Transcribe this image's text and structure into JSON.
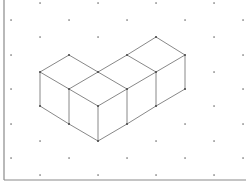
{
  "diagram": {
    "colors": {
      "background": "#ffffff",
      "edge": "#7a7a7a",
      "dot": "#555555",
      "frame": "#8a8a8a"
    },
    "frame": {
      "left_x": 4,
      "bottom_y": 180
    },
    "grid": {
      "odd_columns_x": [
        11,
        69,
        127,
        185,
        243
      ],
      "odd_rows_y": [
        20,
        55,
        89,
        124,
        158
      ],
      "even_columns_x": [
        40,
        98,
        156,
        214
      ],
      "even_rows_y": [
        3,
        37,
        72,
        106,
        141,
        175
      ]
    },
    "vertices": [
      [
        69,
        55
      ],
      [
        40,
        72
      ],
      [
        98,
        72
      ],
      [
        127,
        55
      ],
      [
        156,
        37
      ],
      [
        185,
        55
      ],
      [
        156,
        72
      ],
      [
        127,
        89
      ],
      [
        69,
        89
      ],
      [
        98,
        106
      ],
      [
        40,
        106
      ],
      [
        69,
        124
      ],
      [
        98,
        141
      ],
      [
        127,
        124
      ],
      [
        156,
        106
      ],
      [
        185,
        89
      ]
    ],
    "edges": [
      [
        [
          69,
          55
        ],
        [
          40,
          72
        ]
      ],
      [
        [
          69,
          55
        ],
        [
          98,
          72
        ]
      ],
      [
        [
          98,
          72
        ],
        [
          127,
          55
        ]
      ],
      [
        [
          127,
          55
        ],
        [
          156,
          37
        ]
      ],
      [
        [
          156,
          37
        ],
        [
          185,
          55
        ]
      ],
      [
        [
          127,
          55
        ],
        [
          156,
          72
        ]
      ],
      [
        [
          185,
          55
        ],
        [
          156,
          72
        ]
      ],
      [
        [
          98,
          72
        ],
        [
          127,
          89
        ]
      ],
      [
        [
          156,
          72
        ],
        [
          127,
          89
        ]
      ],
      [
        [
          98,
          72
        ],
        [
          69,
          89
        ]
      ],
      [
        [
          40,
          72
        ],
        [
          69,
          89
        ]
      ],
      [
        [
          69,
          89
        ],
        [
          98,
          106
        ]
      ],
      [
        [
          127,
          89
        ],
        [
          98,
          106
        ]
      ],
      [
        [
          40,
          72
        ],
        [
          40,
          106
        ]
      ],
      [
        [
          69,
          89
        ],
        [
          69,
          124
        ]
      ],
      [
        [
          98,
          106
        ],
        [
          98,
          141
        ]
      ],
      [
        [
          127,
          89
        ],
        [
          127,
          124
        ]
      ],
      [
        [
          156,
          72
        ],
        [
          156,
          106
        ]
      ],
      [
        [
          185,
          55
        ],
        [
          185,
          89
        ]
      ],
      [
        [
          40,
          106
        ],
        [
          69,
          124
        ]
      ],
      [
        [
          69,
          124
        ],
        [
          98,
          141
        ]
      ],
      [
        [
          98,
          141
        ],
        [
          127,
          124
        ]
      ],
      [
        [
          127,
          124
        ],
        [
          156,
          106
        ]
      ],
      [
        [
          156,
          106
        ],
        [
          185,
          89
        ]
      ]
    ],
    "cube_count": 4
  }
}
